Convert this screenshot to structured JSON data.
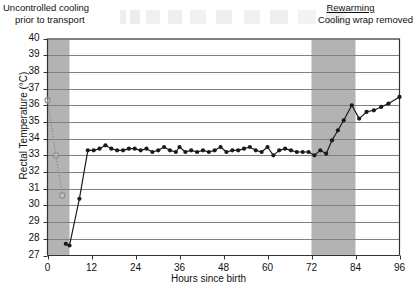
{
  "annotations": {
    "left": {
      "line1": "Uncontrolled cooling",
      "line2": "prior to transport"
    },
    "right": {
      "line1": "Rewarming",
      "line2": "Cooling wrap removed"
    }
  },
  "chart_data": {
    "type": "line",
    "title": "",
    "xlabel": "Hours since birth",
    "ylabel": "Rectal Temperature (°C)",
    "xlim": [
      0,
      96
    ],
    "ylim": [
      27,
      40
    ],
    "xticks": [
      0,
      12,
      24,
      36,
      48,
      60,
      72,
      84,
      96
    ],
    "yticks": [
      27,
      28,
      29,
      30,
      31,
      32,
      33,
      34,
      35,
      36,
      37,
      38,
      39,
      40
    ],
    "grid": "horizontal",
    "legend": "none",
    "colors": {
      "line": "#1a1a1a",
      "marker_filled": "#1a1a1a",
      "marker_open": "#8c8c8c",
      "shaded_band": "#b3b3b3",
      "gridline": "#808080",
      "axis": "#333333"
    },
    "shaded_bands": [
      {
        "name": "uncontrolled-cooling",
        "x0": 0,
        "x1": 6
      },
      {
        "name": "rewarming",
        "x0": 72,
        "x1": 84
      }
    ],
    "series": [
      {
        "name": "Uncontrolled cooling phase",
        "style": "dotted",
        "marker": "open-circle",
        "points": [
          [
            0.0,
            36.3
          ],
          [
            2.3,
            33.0
          ],
          [
            4.0,
            30.6
          ]
        ]
      },
      {
        "name": "Rectal temperature",
        "style": "solid",
        "marker": "filled-circle",
        "points": [
          [
            5.0,
            27.7
          ],
          [
            6.0,
            27.6
          ],
          [
            8.7,
            30.4
          ],
          [
            11.0,
            33.3
          ],
          [
            12.6,
            33.3
          ],
          [
            14.2,
            33.4
          ],
          [
            15.8,
            33.6
          ],
          [
            17.4,
            33.4
          ],
          [
            19.0,
            33.3
          ],
          [
            20.6,
            33.3
          ],
          [
            22.2,
            33.4
          ],
          [
            23.8,
            33.4
          ],
          [
            25.4,
            33.3
          ],
          [
            27.0,
            33.4
          ],
          [
            28.6,
            33.2
          ],
          [
            30.2,
            33.3
          ],
          [
            31.8,
            33.5
          ],
          [
            33.4,
            33.3
          ],
          [
            35.0,
            33.2
          ],
          [
            36.0,
            33.5
          ],
          [
            37.6,
            33.2
          ],
          [
            39.2,
            33.3
          ],
          [
            40.8,
            33.2
          ],
          [
            42.4,
            33.3
          ],
          [
            44.0,
            33.2
          ],
          [
            45.6,
            33.3
          ],
          [
            47.2,
            33.5
          ],
          [
            48.8,
            33.2
          ],
          [
            50.4,
            33.3
          ],
          [
            52.0,
            33.3
          ],
          [
            53.6,
            33.4
          ],
          [
            55.2,
            33.5
          ],
          [
            56.8,
            33.3
          ],
          [
            58.4,
            33.2
          ],
          [
            60.0,
            33.5
          ],
          [
            61.6,
            33.0
          ],
          [
            63.2,
            33.3
          ],
          [
            64.8,
            33.4
          ],
          [
            66.4,
            33.3
          ],
          [
            68.0,
            33.2
          ],
          [
            69.6,
            33.2
          ],
          [
            71.2,
            33.2
          ],
          [
            72.8,
            33.0
          ],
          [
            74.4,
            33.3
          ],
          [
            76.0,
            33.1
          ],
          [
            77.6,
            33.9
          ],
          [
            79.2,
            34.5
          ],
          [
            80.8,
            35.1
          ],
          [
            83.0,
            36.0
          ],
          [
            85.0,
            35.2
          ],
          [
            87.0,
            35.6
          ],
          [
            89.0,
            35.7
          ],
          [
            91.0,
            35.9
          ],
          [
            93.0,
            36.1
          ],
          [
            96.0,
            36.5
          ]
        ]
      }
    ]
  }
}
